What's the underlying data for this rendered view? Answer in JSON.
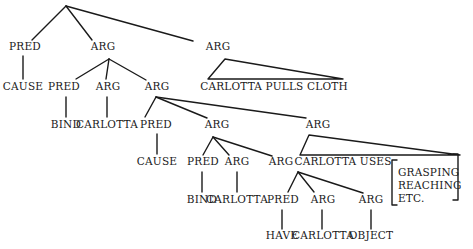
{
  "diagram": {
    "type": "syntax-tree",
    "nodes": [
      {
        "id": "l1_pred",
        "label": "PRED",
        "x": 25,
        "y": 50
      },
      {
        "id": "l1_cause",
        "label": "CAUSE",
        "x": 23,
        "y": 90
      },
      {
        "id": "l1_arg",
        "label": "ARG",
        "x": 103,
        "y": 50
      },
      {
        "id": "l1_arg2",
        "label": "ARG",
        "x": 218,
        "y": 50
      },
      {
        "id": "pulls",
        "label": "CARLOTTA PULLS CLOTH",
        "x": 274,
        "y": 90
      },
      {
        "id": "l2_pred",
        "label": "PRED",
        "x": 64,
        "y": 90
      },
      {
        "id": "l2_arg",
        "label": "ARG",
        "x": 108,
        "y": 90
      },
      {
        "id": "l2_arg2",
        "label": "ARG",
        "x": 157,
        "y": 90
      },
      {
        "id": "bind1",
        "label": "BIND",
        "x": 66,
        "y": 128
      },
      {
        "id": "carlotta1",
        "label": "CARLOTTA",
        "x": 107,
        "y": 128
      },
      {
        "id": "l3_pred",
        "label": "PRED",
        "x": 156,
        "y": 128
      },
      {
        "id": "l3_arg",
        "label": "ARG",
        "x": 217,
        "y": 128
      },
      {
        "id": "l3_arg2",
        "label": "ARG",
        "x": 318,
        "y": 128
      },
      {
        "id": "cause2",
        "label": "CAUSE",
        "x": 157,
        "y": 165
      },
      {
        "id": "l4_pred",
        "label": "PRED",
        "x": 203,
        "y": 165
      },
      {
        "id": "l4_arg",
        "label": "ARG",
        "x": 237,
        "y": 165
      },
      {
        "id": "l4_arg2",
        "label": "ARG",
        "x": 281,
        "y": 165
      },
      {
        "id": "uses",
        "label": "CARLOTTA USES",
        "x": 343,
        "y": 165
      },
      {
        "id": "bind2",
        "label": "BIND",
        "x": 202,
        "y": 203
      },
      {
        "id": "carlotta2",
        "label": "CARLOTTA",
        "x": 237,
        "y": 203
      },
      {
        "id": "l5_pred",
        "label": "PRED",
        "x": 283,
        "y": 203
      },
      {
        "id": "l5_arg",
        "label": "ARG",
        "x": 323,
        "y": 203
      },
      {
        "id": "l5_arg2",
        "label": "ARG",
        "x": 371,
        "y": 203
      },
      {
        "id": "have",
        "label": "HAVE",
        "x": 282,
        "y": 239
      },
      {
        "id": "carlotta3",
        "label": "CARLOTTA",
        "x": 323,
        "y": 239
      },
      {
        "id": "object",
        "label": "OBJECT",
        "x": 371,
        "y": 239
      }
    ],
    "bracket_items": [
      "GRASPING",
      "REACHING",
      "ETC."
    ],
    "edges": [
      [
        66,
        6,
        32,
        40
      ],
      [
        66,
        6,
        92,
        40
      ],
      [
        66,
        6,
        193,
        41
      ],
      [
        23,
        56,
        23,
        79
      ],
      [
        109,
        59,
        76,
        79
      ],
      [
        109,
        59,
        106,
        79
      ],
      [
        109,
        59,
        146,
        80
      ],
      [
        66,
        97,
        66,
        117
      ],
      [
        107,
        97,
        107,
        117
      ],
      [
        156,
        97,
        145,
        117
      ],
      [
        156,
        97,
        207,
        118
      ],
      [
        156,
        97,
        306,
        118
      ],
      [
        157,
        134,
        157,
        154
      ],
      [
        213,
        137,
        203,
        155
      ],
      [
        213,
        137,
        229,
        155
      ],
      [
        213,
        137,
        272,
        156
      ],
      [
        202,
        172,
        202,
        192
      ],
      [
        237,
        172,
        237,
        192
      ],
      [
        298,
        172,
        288,
        192
      ],
      [
        298,
        172,
        314,
        192
      ],
      [
        298,
        172,
        363,
        193
      ],
      [
        282,
        210,
        282,
        229
      ],
      [
        322,
        210,
        322,
        229
      ],
      [
        371,
        210,
        371,
        229
      ]
    ],
    "triangles": [
      [
        [
          225,
          59
        ],
        [
          208,
          79
        ],
        [
          343,
          79
        ]
      ],
      [
        [
          309,
          135
        ],
        [
          300,
          155
        ],
        [
          460,
          155
        ]
      ]
    ]
  }
}
